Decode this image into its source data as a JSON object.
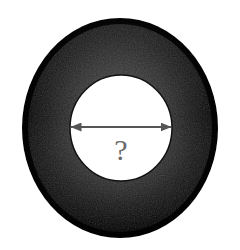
{
  "figure": {
    "type": "geometry-diagram",
    "background_color": "#ffffff",
    "canvas": {
      "width": 240,
      "height": 250
    }
  },
  "outer_disk": {
    "name": "outer-disk",
    "shape": "circle",
    "center_x": 120,
    "center_y": 128,
    "radius_x": 98,
    "radius_y": 110,
    "fill_color": "#0b0b0b",
    "edge_color": "#000000",
    "inner_tone_color": "#3b3b3b",
    "texture": "grainy"
  },
  "inner_hole": {
    "name": "inner-hole",
    "shape": "circle",
    "center_x": 121,
    "center_y": 128,
    "radius_x": 51,
    "radius_y": 53,
    "fill_color": "#ffffff",
    "stroke_color": "#111111",
    "stroke_width": 1.5
  },
  "dimension_arrow": {
    "name": "diameter-arrow",
    "orientation": "horizontal",
    "measures": "diameter",
    "x_start": 71,
    "x_end": 171,
    "y": 127,
    "line_color": "#555555",
    "line_width": 2,
    "arrowhead_style": "solid-triangle",
    "arrowhead_length": 11,
    "arrowhead_width": 9,
    "double_headed": true
  },
  "dimension_label": {
    "name": "unknown-diameter-label",
    "text": "?",
    "x": 121,
    "y": 148,
    "color": "#6a6a6a",
    "font_size": 30
  }
}
